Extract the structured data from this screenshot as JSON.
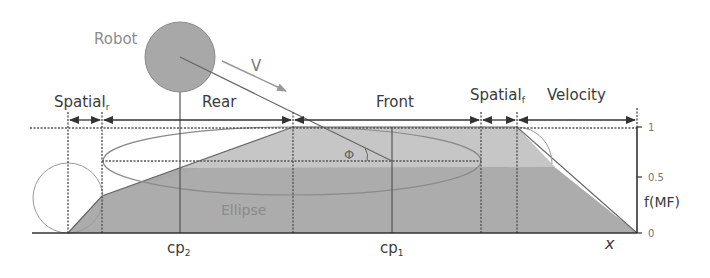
{
  "labels": {
    "robot": "Robot",
    "velocity_vector": "V",
    "spatial_r": "Spatial",
    "spatial_r_sub": "r",
    "rear": "Rear",
    "front": "Front",
    "spatial_f": "Spatial",
    "spatial_f_sub": "f",
    "velocity": "Velocity",
    "phi": "Φ",
    "ellipse": "Ellipse",
    "cp2": "cp",
    "cp2_sub": "2",
    "cp1": "cp",
    "cp1_sub": "1",
    "x_axis": "x",
    "y_axis": "f(MF)"
  },
  "y_ticks": [
    "1",
    "0.5",
    "0"
  ],
  "colors": {
    "dark_fill": "#a9a9a9",
    "light_fill": "#c8c8c8",
    "robot_fill": "#a8a8a8",
    "line": "#444444",
    "thin_line": "#888888",
    "label_text": "#3a3a3a",
    "ellipse_text": "#8a8a8a",
    "robot_text": "#8c8c8c"
  }
}
